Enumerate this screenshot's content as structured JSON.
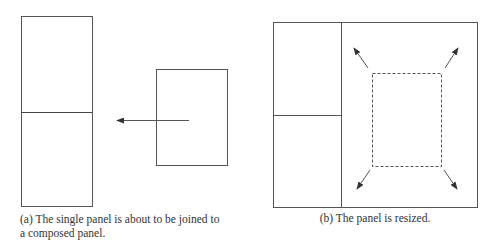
{
  "figures": [
    {
      "id": "a",
      "caption_lines": [
        "(a) The single panel is about to be joined to",
        "a composed panel."
      ],
      "elements": {
        "composed_panel": {
          "x": 21,
          "y": 16,
          "w": 71,
          "h": 190,
          "split_y": 112
        },
        "single_panel": {
          "x": 156,
          "y": 69,
          "w": 71,
          "h": 96
        },
        "join_arrow": {
          "x1": 189,
          "y1": 120,
          "x2": 116,
          "y2": 120,
          "direction": "left"
        }
      }
    },
    {
      "id": "b",
      "caption_lines": [
        "(b) The panel is resized."
      ],
      "elements": {
        "outer_panel": {
          "x": 273,
          "y": 22,
          "w": 204,
          "h": 185
        },
        "column_divider_x": 341,
        "left_column_split_y": 115,
        "resizing_panel_dashed": {
          "x": 372,
          "y": 73,
          "w": 69,
          "h": 93
        },
        "resize_arrows": [
          {
            "name": "top-left",
            "x1": 368,
            "y1": 68,
            "x2": 353,
            "y2": 47
          },
          {
            "name": "top-right",
            "x1": 443,
            "y1": 68,
            "x2": 458,
            "y2": 47
          },
          {
            "name": "bottom-left",
            "x1": 370,
            "y1": 169,
            "x2": 356,
            "y2": 190
          },
          {
            "name": "bottom-right",
            "x1": 443,
            "y1": 169,
            "x2": 458,
            "y2": 190
          }
        ]
      }
    }
  ],
  "colors": {
    "line": "#555555",
    "arrow": "#444444",
    "text": "#333333",
    "background": "#ffffff"
  }
}
